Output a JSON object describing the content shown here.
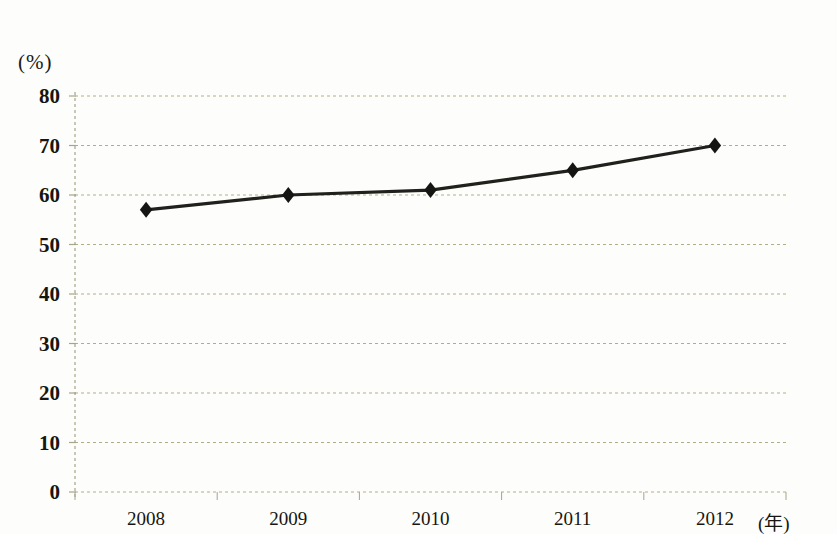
{
  "chart_data": {
    "type": "line",
    "title": "",
    "subtitle": "",
    "xlabel": "(年)",
    "ylabel": "(%)",
    "categories": [
      "2008",
      "2009",
      "2010",
      "2011",
      "2012"
    ],
    "values": [
      57,
      60,
      61,
      65,
      70
    ],
    "series": [
      {
        "name": "",
        "values": [
          57,
          60,
          61,
          65,
          70
        ]
      }
    ],
    "ylim": [
      0,
      80
    ],
    "y_ticks": [
      0,
      10,
      20,
      30,
      40,
      50,
      60,
      70,
      80
    ],
    "y_tick_labels": [
      "0",
      "10",
      "20",
      "30",
      "40",
      "50",
      "60",
      "70",
      "80"
    ],
    "x_tick_labels": [
      "2008",
      "2009",
      "2010",
      "2011",
      "2012"
    ],
    "grid": true,
    "grid_style": "dotted",
    "legend": false,
    "legend_position": "none",
    "marker": "diamond",
    "annotations": []
  },
  "style": {
    "background_color": "#fdfdfb",
    "grid_color": "#b3ad86",
    "axis_color": "#a8a488",
    "line_color": "#20201c",
    "marker_color": "#151513",
    "text_color": "#17150f"
  },
  "axes": {
    "y_unit_label": "(%)",
    "x_unit_label": "(年)"
  }
}
